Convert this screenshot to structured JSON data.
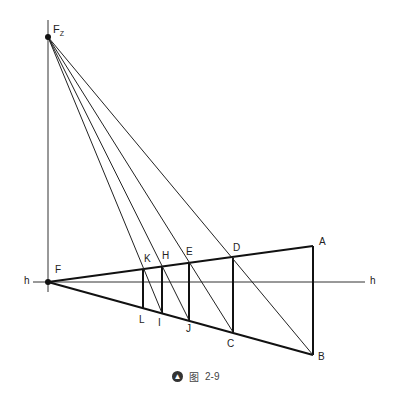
{
  "figure": {
    "caption_prefix": "图",
    "caption_number": "2-9",
    "icon": "arrow-up-circle-icon"
  },
  "labels": {
    "Fz": "F",
    "Fz_sub": "Z",
    "F": "F",
    "h_left": "h",
    "h_right": "h",
    "A": "A",
    "B": "B",
    "C": "C",
    "D": "D",
    "E": "E",
    "H": "H",
    "K": "K",
    "L": "L",
    "I": "I",
    "J": "J"
  },
  "points": {
    "Fz": [
      48,
      37
    ],
    "F": [
      48,
      282
    ],
    "A": [
      313,
      246
    ],
    "B": [
      313,
      355
    ],
    "D": [
      233,
      258
    ],
    "C": [
      233,
      332
    ],
    "E": [
      189,
      263
    ],
    "J": [
      189,
      320
    ],
    "H": [
      162,
      266
    ],
    "I": [
      162,
      313
    ],
    "K": [
      143,
      269
    ],
    "L": [
      143,
      309
    ]
  },
  "colors": {
    "line": "#111111",
    "thin_line": "#333333",
    "text": "#222222"
  }
}
